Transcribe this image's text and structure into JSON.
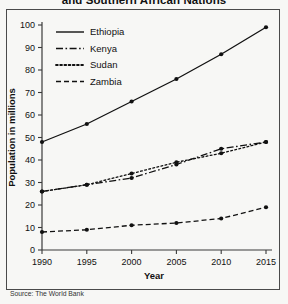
{
  "chart_data": {
    "type": "line",
    "title": "and Southern African Nations",
    "xlabel": "Year",
    "ylabel": "Population in millions",
    "x": [
      1990,
      1995,
      2000,
      2005,
      2010,
      2015
    ],
    "xticklabels": [
      "1990",
      "1995",
      "2000",
      "2005",
      "2010",
      "2015"
    ],
    "yticklabels": [
      "0",
      "10",
      "20",
      "30",
      "40",
      "50",
      "60",
      "70",
      "80",
      "90",
      "100"
    ],
    "yticks": [
      0,
      10,
      20,
      30,
      40,
      50,
      60,
      70,
      80,
      90,
      100
    ],
    "ylim": [
      0,
      100
    ],
    "xlim": [
      1990,
      2015
    ],
    "grid": false,
    "legend_position": "top-left",
    "markers": "filled-circle",
    "source": "Source: The World Bank",
    "series": [
      {
        "name": "Ethiopia",
        "style": "solid",
        "values": [
          48,
          56,
          66,
          76,
          87,
          99
        ]
      },
      {
        "name": "Kenya",
        "style": "dash-dot",
        "values": [
          26,
          29,
          32,
          38,
          45,
          48
        ]
      },
      {
        "name": "Sudan",
        "style": "dotted",
        "values": [
          26,
          29,
          34,
          39,
          43,
          48
        ]
      },
      {
        "name": "Zambia",
        "style": "dashed",
        "values": [
          8,
          9,
          11,
          12,
          14,
          19
        ]
      }
    ]
  },
  "legend": {
    "items": [
      {
        "label": "Ethiopia"
      },
      {
        "label": "Kenya"
      },
      {
        "label": "Sudan"
      },
      {
        "label": "Zambia"
      }
    ]
  }
}
